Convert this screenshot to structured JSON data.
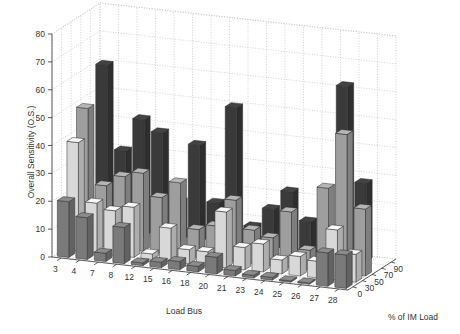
{
  "chart_data": {
    "type": "bar3d",
    "title": "",
    "xlabel": "Load Bus",
    "ylabel": "% of IM Load",
    "zlabel": "Overall Sensitivity (O.S.)",
    "zlim": [
      0,
      80
    ],
    "z_ticks": [
      "0",
      "10",
      "20",
      "30",
      "40",
      "50",
      "60",
      "70",
      "80"
    ],
    "grid": true,
    "categories": [
      "3",
      "4",
      "7",
      "8",
      "12",
      "15",
      "16",
      "18",
      "20",
      "21",
      "23",
      "24",
      "25",
      "26",
      "27",
      "28"
    ],
    "depth_categories": [
      "0",
      "30",
      "50",
      "70",
      "90"
    ],
    "series": [
      {
        "name": "0",
        "color": "#7a7a7a",
        "values": [
          20,
          15,
          3,
          13,
          1,
          2,
          3,
          2,
          6,
          2,
          1,
          1,
          0.5,
          0.5,
          12,
          12
        ]
      },
      {
        "name": "30",
        "color": "#d8d8d8",
        "values": [
          39,
          18,
          16,
          18,
          2,
          12,
          5,
          5,
          20,
          8,
          10,
          5,
          7,
          6,
          18,
          10
        ]
      },
      {
        "name": "50",
        "color": "#9e9e9e",
        "values": [
          49,
          22,
          26,
          28,
          20,
          26,
          10,
          12,
          22,
          12,
          10,
          20,
          7,
          30,
          50,
          24
        ]
      },
      {
        "name": "70",
        "color": "#9e9e9e",
        "values": [
          0,
          0,
          0,
          0,
          0,
          0,
          0,
          0,
          0,
          0,
          0,
          0,
          0,
          0,
          0,
          0
        ]
      },
      {
        "name": "90",
        "color": "#3a3a3a",
        "values": [
          60,
          30,
          42,
          38,
          14,
          35,
          15,
          50,
          8,
          15,
          22,
          12,
          10,
          62,
          28,
          0
        ]
      }
    ],
    "note": "Heights are approximate readings from a 3D perspective bar chart; the 70% row is largely occluded"
  },
  "labels": {
    "xlabel": "Load Bus",
    "ylabel": "% of IM Load",
    "zlabel": "Overall Sensitivity (O.S.)"
  }
}
